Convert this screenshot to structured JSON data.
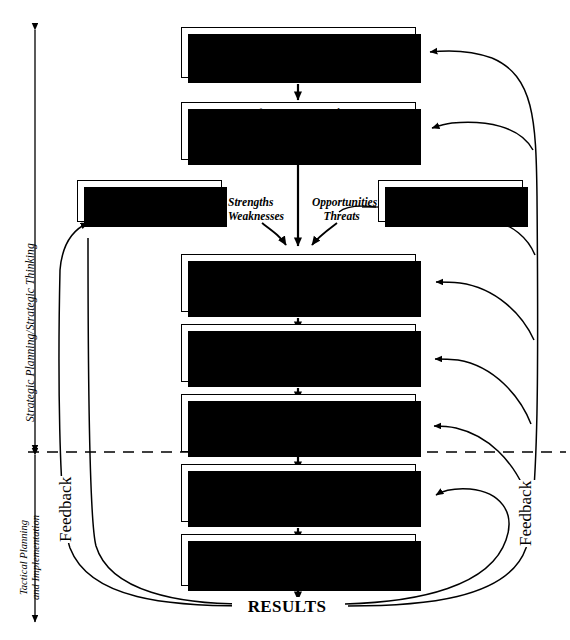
{
  "diagram": {
    "boxes": {
      "plan_for_planning": "“Plan for Planning”",
      "foundation_bullets": [
        "Mission of Institution/Academic Unit",
        "Assessment of Stakeholder Values",
        "Key Performance Indicators (KPI)"
      ],
      "internal_assessment_line1": "Internal",
      "internal_assessment_line2": "Assessment",
      "external_assessment_line1": "External",
      "external_assessment_line2": "Assessment",
      "develop_assess_line1": "Develop and Assess",
      "develop_assess_line2": "Strategic Issues and Actions",
      "develop_strategies": "Develop Strategies",
      "generate_vision_line1": "Generate Vision of the",
      "generate_vision_line2": "Organization of the Future",
      "tactical_planning": "Tactical Planning",
      "implementation": "Implementation",
      "results": "RESULTS"
    },
    "swot": {
      "internal_out_line1": "Strengths",
      "internal_out_line2": "Weaknesses",
      "external_out_line1": "Opportunities",
      "external_out_line2": "Threats"
    },
    "phase_labels": {
      "upper": "Strategic Planning/Strategic Thinking",
      "lower_line1": "Tactical Planning",
      "lower_line2": "and Implementation"
    },
    "feedback": {
      "left_label": "Feedback",
      "right_label": "Feedback"
    },
    "colors": {
      "ink": "#000000",
      "paper": "#ffffff"
    }
  }
}
